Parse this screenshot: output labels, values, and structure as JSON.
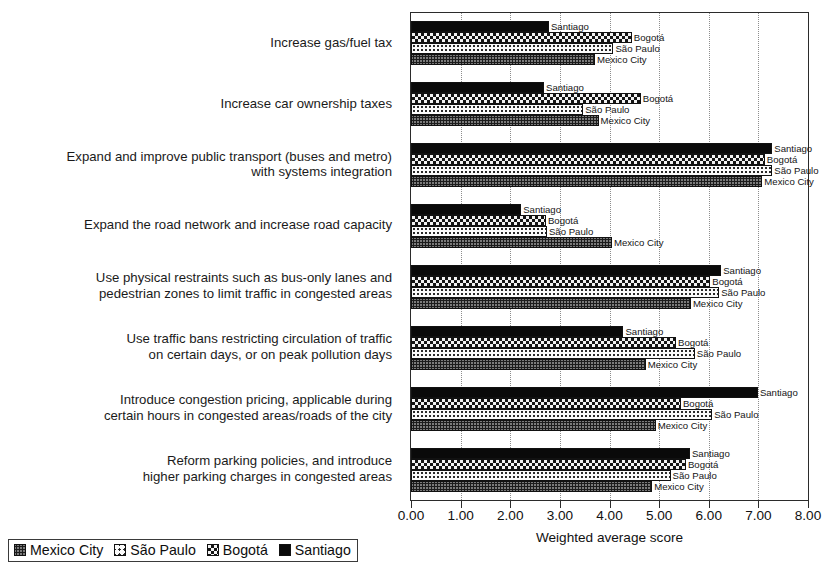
{
  "chart_data": {
    "type": "bar",
    "orientation": "horizontal",
    "title": "",
    "xlabel": "Weighted average score",
    "ylabel": "",
    "xlim": [
      0,
      8
    ],
    "xticks": [
      "0.00",
      "1.00",
      "2.00",
      "3.00",
      "4.00",
      "5.00",
      "6.00",
      "7.00",
      "8.00"
    ],
    "grid": "vertical dotted gridlines at each tick",
    "legend_position": "bottom-left, outside plot",
    "categories": [
      "Increase gas/fuel tax",
      "Increase car ownership taxes",
      "Expand and improve public transport (buses and metro)\nwith systems integration",
      "Expand the road network and increase road capacity",
      "Use physical restraints such as bus-only lanes and\npedestrian zones to limit traffic in congested areas",
      "Use traffic bans restricting circulation of traffic\non certain days, or on peak pollution days",
      "Introduce congestion pricing, applicable during\ncertain hours in congested areas/roads of the city",
      "Reform parking policies, and introduce\nhigher parking charges in congested areas"
    ],
    "series": [
      {
        "name": "Santiago",
        "key": "santiago",
        "pattern": "solid-black",
        "color": "#0a0a0a",
        "values": [
          2.78,
          2.68,
          7.28,
          2.22,
          6.25,
          4.28,
          6.99,
          5.62
        ]
      },
      {
        "name": "Bogotá",
        "key": "bogota",
        "pattern": "checkerboard",
        "color": "#141414",
        "values": [
          4.45,
          4.63,
          7.13,
          2.72,
          6.03,
          5.34,
          5.44,
          5.54
        ]
      },
      {
        "name": "São Paulo",
        "key": "saopaulo",
        "pattern": "light-dots",
        "color": "#fbfbfb",
        "values": [
          4.08,
          3.47,
          7.28,
          2.74,
          6.21,
          5.72,
          6.07,
          5.23
        ]
      },
      {
        "name": "Mexico City",
        "key": "mexicocity",
        "pattern": "dark-gray-dots",
        "color": "#7b7b7b",
        "values": [
          3.71,
          3.78,
          7.08,
          4.05,
          5.64,
          4.73,
          4.93,
          4.86
        ]
      }
    ],
    "bar_end_labels": [
      "Santiago",
      "Bogotá",
      "São Paulo",
      "Mexico City"
    ]
  },
  "legend": {
    "items": [
      {
        "label": "Mexico City",
        "key": "mexicocity"
      },
      {
        "label": "São Paulo",
        "key": "saopaulo"
      },
      {
        "label": "Bogotá",
        "key": "bogota"
      },
      {
        "label": "Santiago",
        "key": "santiago"
      }
    ]
  },
  "axis": {
    "title": "Weighted average score"
  }
}
